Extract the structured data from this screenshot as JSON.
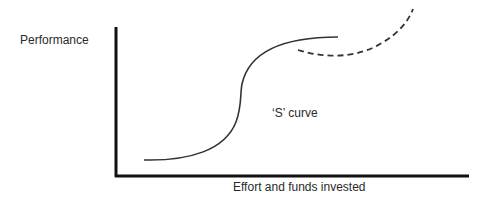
{
  "diagram": {
    "y_axis_label": "Performance",
    "x_axis_label": "Effort and funds invested",
    "curve_label": "‘S’ curve",
    "colors": {
      "axis": "#111111",
      "curve": "#333333",
      "dashed_curve": "#333333",
      "background": "#ffffff"
    },
    "curves": [
      {
        "name": "s-curve",
        "style": "solid"
      },
      {
        "name": "next-s-curve",
        "style": "dashed"
      }
    ]
  }
}
